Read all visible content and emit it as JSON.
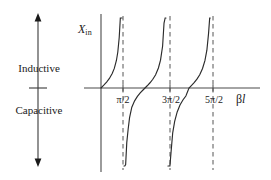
{
  "figure": {
    "background_color": "#ffffff",
    "line_color": "#333333",
    "dashed_color": "#555555"
  },
  "annotation": {
    "arrow_name": "reactance-sign-arrow",
    "upper_label": "Inductive",
    "lower_label": "Capacitive",
    "up_arrow_icon": "arrow-up-icon",
    "down_arrow_icon": "arrow-down-icon",
    "center_tick_icon": "center-tick-icon"
  },
  "axes": {
    "y_label": "X",
    "y_label_subscript": "in",
    "x_label_symbol": "β",
    "x_label_variable": "l",
    "x_ticks": [
      {
        "label": "π/2",
        "value": 1.5708
      },
      {
        "label": "3π/2",
        "value": 4.7124
      },
      {
        "label": "5π/2",
        "value": 7.854
      }
    ]
  },
  "chart_data": {
    "type": "line",
    "title": "",
    "xlabel": "βl",
    "ylabel": "X_in",
    "function": "tan",
    "grid": false,
    "legend": false,
    "xlim": [
      0,
      9.42
    ],
    "ylim": [
      -4,
      4
    ],
    "asymptotes": [
      1.5708,
      4.7124,
      7.854
    ],
    "zero_crossings": [
      0,
      3.1416,
      6.2832
    ],
    "series": [
      {
        "name": "branch-1",
        "x": [
          0.0,
          0.2,
          0.4,
          0.6,
          0.8,
          0.95,
          1.1,
          1.2,
          1.3,
          1.38,
          1.44,
          1.48,
          1.5
        ],
        "y": [
          0.0,
          0.203,
          0.423,
          0.684,
          1.03,
          1.398,
          1.965,
          2.572,
          3.602,
          5.177,
          6.94,
          9.12,
          14.1
        ]
      },
      {
        "name": "branch-2",
        "x": [
          1.64,
          1.7,
          1.76,
          1.84,
          1.94,
          2.04,
          2.2,
          2.4,
          2.6,
          2.8,
          3.0,
          3.1416,
          3.3,
          3.5,
          3.7,
          3.9,
          4.1,
          4.25,
          4.4,
          4.5,
          4.58,
          4.64
        ],
        "y": [
          -14.1,
          -7.7,
          -5.47,
          -3.9,
          -2.93,
          -2.12,
          -1.37,
          -0.916,
          -0.602,
          -0.356,
          -0.143,
          0.0,
          0.159,
          0.375,
          0.624,
          0.947,
          1.43,
          1.99,
          3.0,
          4.64,
          7.3,
          11.1
        ]
      },
      {
        "name": "branch-3",
        "x": [
          4.78,
          4.85,
          4.92,
          5.0,
          5.12,
          5.26,
          5.44,
          5.64,
          5.86,
          6.06,
          6.2832,
          6.45,
          6.65,
          6.85,
          7.05,
          7.25,
          7.42,
          7.56,
          7.68,
          7.76,
          7.8
        ],
        "y": [
          -14.1,
          -8.6,
          -6.2,
          -4.6,
          -3.2,
          -2.38,
          -1.71,
          -1.22,
          -0.84,
          -0.57,
          0.0,
          0.17,
          0.38,
          0.63,
          0.94,
          1.39,
          1.95,
          2.7,
          3.9,
          5.6,
          7.9
        ]
      }
    ]
  }
}
